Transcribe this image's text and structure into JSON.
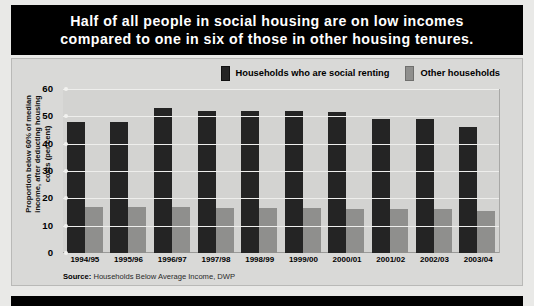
{
  "title": {
    "line1": "Half of all people in social housing are on low incomes",
    "line2": "compared to one in six of those in other housing tenures."
  },
  "legend": {
    "items": [
      {
        "label": "Households who are social renting",
        "color": "#242424",
        "swatch": "dark"
      },
      {
        "label": "Other households",
        "color": "#8f8f8d",
        "swatch": "grey"
      }
    ]
  },
  "axis": {
    "y_title_line1": "Proportion below 60% of median",
    "y_title_line2": "income, after deducting housing",
    "y_title_line3": "costs (per cent)",
    "ticks": [
      "60",
      "50",
      "40",
      "30",
      "20",
      "10",
      "0"
    ]
  },
  "source": {
    "label": "Source:",
    "text": "Households Below Average Income, DWP"
  },
  "chart_data": {
    "type": "bar",
    "title": "Half of all people in social housing are on low incomes compared to one in six of those in other housing tenures.",
    "xlabel": "",
    "ylabel": "Proportion below 60% of median income, after deducting housing costs (per cent)",
    "ylim": [
      0,
      60
    ],
    "yticks": [
      0,
      10,
      20,
      30,
      40,
      50,
      60
    ],
    "grid": true,
    "legend_position": "top-right",
    "categories": [
      "1994/95",
      "1995/96",
      "1996/97",
      "1997/98",
      "1998/99",
      "1999/00",
      "2000/01",
      "2001/02",
      "2002/03",
      "2003/04"
    ],
    "series": [
      {
        "name": "Households who are social renting",
        "color": "#242424",
        "values": [
          48,
          48,
          53,
          52,
          52,
          52,
          51.5,
          49,
          49,
          46
        ]
      },
      {
        "name": "Other households",
        "color": "#8f8f8d",
        "values": [
          17,
          17,
          17,
          16.5,
          16.5,
          16.5,
          16,
          16,
          16,
          15.5
        ]
      }
    ]
  }
}
